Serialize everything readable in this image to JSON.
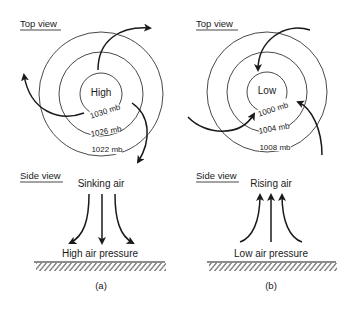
{
  "panels": [
    {
      "id": "a",
      "caption": "(a)",
      "top_view_label": "Top view",
      "side_view_label": "Side view",
      "center_label": "High",
      "isobars": [
        "1030 mb",
        "1026 mb",
        "1022 mb"
      ],
      "air_motion_label": "Sinking air",
      "pressure_label": "High air pressure",
      "flow": "outward-clockwise"
    },
    {
      "id": "b",
      "caption": "(b)",
      "top_view_label": "Top view",
      "side_view_label": "Side view",
      "center_label": "Low",
      "isobars": [
        "1000 mb",
        "1004 mb",
        "1008 mb"
      ],
      "air_motion_label": "Rising air",
      "pressure_label": "Low air pressure",
      "flow": "inward-counterclockwise"
    }
  ]
}
